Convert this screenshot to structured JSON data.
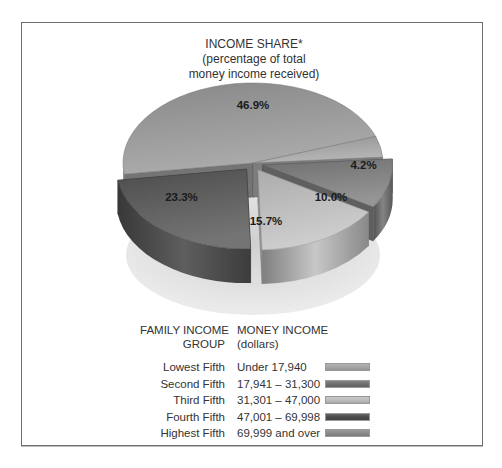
{
  "chart_data": {
    "type": "pie",
    "style": "3d-exploded",
    "title": "INCOME SHARE*",
    "subtitle_lines": [
      "(percentage of total",
      "money income received)"
    ],
    "slices": [
      {
        "group": "Highest Fifth",
        "value": 46.9,
        "label": "46.9%",
        "color": "#9a9a9a",
        "exploded": false
      },
      {
        "group": "Lowest Fifth",
        "value": 4.2,
        "label": "4.2%",
        "color": "#a6a6a6",
        "exploded": false
      },
      {
        "group": "Second Fifth",
        "value": 10.0,
        "label": "10.0%",
        "color": "#7e7e7e",
        "exploded": true
      },
      {
        "group": "Third Fifth",
        "value": 15.7,
        "label": "15.7%",
        "color": "#c4c4c4",
        "exploded": true
      },
      {
        "group": "Fourth Fifth",
        "value": 23.3,
        "label": "23.3%",
        "color": "#565656",
        "exploded": true
      }
    ],
    "legend": {
      "header_group": [
        "FAMILY INCOME",
        "GROUP"
      ],
      "header_income": [
        "MONEY INCOME",
        "(dollars)"
      ],
      "rows": [
        {
          "group": "Lowest Fifth",
          "range": "Under 17,940",
          "color": "#a6a6a6"
        },
        {
          "group": "Second Fifth",
          "range": "17,941 – 31,300",
          "color": "#6e6e6e"
        },
        {
          "group": "Third Fifth",
          "range": "31,301 – 47,000",
          "color": "#bdbdbd"
        },
        {
          "group": "Fourth Fifth",
          "range": "47,001 – 69,998",
          "color": "#4a4a4a"
        },
        {
          "group": "Highest Fifth",
          "range": "69,999 and over",
          "color": "#8a8a8a"
        }
      ],
      "placement": "bottom"
    }
  }
}
